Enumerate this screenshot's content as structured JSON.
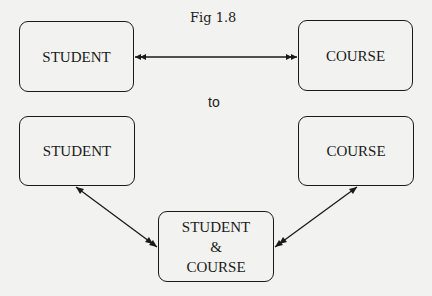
{
  "figure": {
    "caption": "Fig 1.8",
    "transition_label": "to"
  },
  "before": {
    "entities": [
      {
        "id": "student",
        "label": "STUDENT"
      },
      {
        "id": "course",
        "label": "COURSE"
      }
    ],
    "relationship": {
      "from": "student",
      "to": "course",
      "type": "many-to-many"
    }
  },
  "after": {
    "entities": [
      {
        "id": "student",
        "label": "STUDENT"
      },
      {
        "id": "course",
        "label": "COURSE"
      },
      {
        "id": "student_course",
        "label_lines": [
          "STUDENT",
          "&",
          "COURSE"
        ]
      }
    ],
    "relationships": [
      {
        "from": "student",
        "to": "student_course",
        "type": "one-to-many"
      },
      {
        "from": "course",
        "to": "student_course",
        "type": "one-to-many"
      }
    ]
  },
  "colors": {
    "background": "#f2f2f0",
    "ink": "#1a1a1a"
  }
}
